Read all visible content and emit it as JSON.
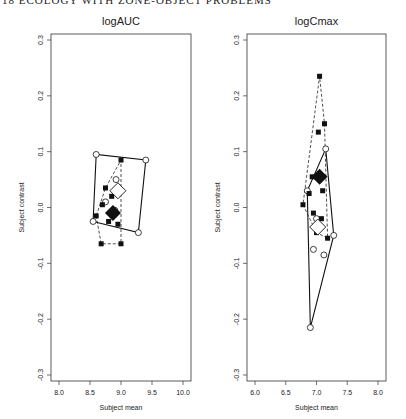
{
  "page_header": "18  ECOLOGY WITH ZONE-OBJECT PROBLEMS",
  "chart_data": [
    {
      "type": "scatter",
      "title": "logAUC",
      "xlabel": "Subject mean",
      "ylabel": "Subject contrast",
      "xlim": [
        8.0,
        10.0
      ],
      "ylim": [
        -0.3,
        0.3
      ],
      "xticks": [
        "8.0",
        "8.5",
        "9.0",
        "9.5",
        "10.0"
      ],
      "yticks": [
        "-0.3",
        "-0.2",
        "-0.1",
        "0.0",
        "0.1",
        "0.2",
        "0.3"
      ],
      "grid": false,
      "series": [
        {
          "name": "open circles (solid hull)",
          "marker": "circle-open",
          "points": [
            [
              8.6,
              0.095
            ],
            [
              9.4,
              0.085
            ],
            [
              9.28,
              -0.045
            ],
            [
              8.55,
              -0.025
            ],
            [
              8.92,
              0.05
            ],
            [
              8.9,
              -0.005
            ],
            [
              8.75,
              0.01
            ]
          ]
        },
        {
          "name": "filled squares (dashed hull)",
          "marker": "square-filled",
          "points": [
            [
              9.0,
              0.085
            ],
            [
              9.0,
              -0.065
            ],
            [
              8.68,
              -0.065
            ],
            [
              8.6,
              -0.015
            ],
            [
              8.75,
              0.035
            ],
            [
              8.95,
              -0.03
            ],
            [
              8.8,
              -0.025
            ],
            [
              8.85,
              0.02
            ],
            [
              8.7,
              0.005
            ]
          ]
        },
        {
          "name": "open diamond mean",
          "marker": "diamond-open",
          "points": [
            [
              8.95,
              0.03
            ]
          ]
        },
        {
          "name": "filled diamond mean",
          "marker": "diamond-filled",
          "points": [
            [
              8.87,
              -0.01
            ]
          ]
        }
      ]
    },
    {
      "type": "scatter",
      "title": "logCmax",
      "xlabel": "Subject mean",
      "ylabel": "Subject contrast",
      "xlim": [
        6.0,
        8.0
      ],
      "ylim": [
        -0.3,
        0.3
      ],
      "xticks": [
        "6.0",
        "6.5",
        "7.0",
        "7.5",
        "8.0"
      ],
      "yticks": [
        "-0.3",
        "-0.2",
        "-0.1",
        "0.0",
        "0.1",
        "0.2",
        "0.3"
      ],
      "grid": false,
      "series": [
        {
          "name": "open circles (solid hull)",
          "marker": "circle-open",
          "points": [
            [
              7.15,
              0.105
            ],
            [
              7.28,
              -0.05
            ],
            [
              6.9,
              -0.215
            ],
            [
              6.85,
              0.03
            ],
            [
              7.12,
              -0.085
            ],
            [
              6.95,
              -0.075
            ],
            [
              7.05,
              -0.035
            ],
            [
              7.0,
              -0.02
            ]
          ]
        },
        {
          "name": "filled squares (dashed hull)",
          "marker": "square-filled",
          "points": [
            [
              7.05,
              0.235
            ],
            [
              7.13,
              0.15
            ],
            [
              7.03,
              0.135
            ],
            [
              7.18,
              -0.055
            ],
            [
              6.95,
              -0.01
            ],
            [
              6.78,
              0.005
            ],
            [
              6.88,
              0.025
            ],
            [
              6.93,
              0.055
            ],
            [
              7.1,
              0.03
            ],
            [
              7.08,
              -0.02
            ],
            [
              7.0,
              -0.045
            ]
          ]
        },
        {
          "name": "open diamond mean",
          "marker": "diamond-open",
          "points": [
            [
              7.02,
              -0.035
            ]
          ]
        },
        {
          "name": "filled diamond mean",
          "marker": "diamond-filled",
          "points": [
            [
              7.05,
              0.055
            ]
          ]
        }
      ]
    }
  ]
}
